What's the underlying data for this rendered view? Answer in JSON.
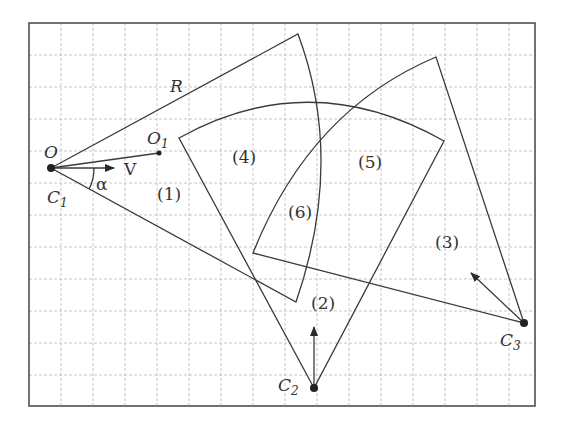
{
  "diagram": {
    "labels": {
      "O": "O",
      "O1": "O",
      "O1_sub": "1",
      "R": "R",
      "V": "V",
      "alpha": "α",
      "C1": "C",
      "C1_sub": "1",
      "C2": "C",
      "C2_sub": "2",
      "C3": "C",
      "C3_sub": "3",
      "region1": "(1)",
      "region2": "(2)",
      "region3": "(3)",
      "region4": "(4)",
      "region5": "(5)",
      "region6": "(6)"
    },
    "colors": {
      "line": "#3a3a3a",
      "grid": "#b8b8b8",
      "background": "#ffffff"
    }
  }
}
